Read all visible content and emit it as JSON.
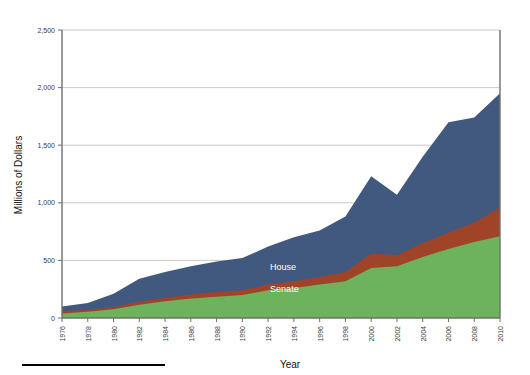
{
  "chart_data": {
    "type": "area",
    "stacked": true,
    "title": "",
    "subtitle": "",
    "xlabel": "Year",
    "ylabel": "Millions of Dollars",
    "xlim": [
      1976,
      2010
    ],
    "ylim": [
      0,
      2500
    ],
    "yticks": [
      0,
      500,
      1000,
      1500,
      2000,
      2500
    ],
    "ytick_labels": [
      "0",
      "500",
      "1,000",
      "1,500",
      "2,000",
      "2,500"
    ],
    "grid": "horizontal",
    "legend_position": "inline-annotations",
    "x": [
      1976,
      1978,
      1980,
      1982,
      1984,
      1986,
      1988,
      1990,
      1992,
      1994,
      1996,
      1998,
      2000,
      2002,
      2004,
      2006,
      2008,
      2010
    ],
    "xtick_labels": [
      "1976",
      "1978",
      "1980",
      "1982",
      "1984",
      "1986",
      "1988",
      "1990",
      "1992",
      "1994",
      "1996",
      "1998",
      "2000",
      "2002",
      "2004",
      "2006",
      "2008",
      "2010"
    ],
    "series": [
      {
        "name": "Senate",
        "color": "#6cb35c",
        "label_text": "Senate",
        "values": [
          40,
          55,
          75,
          115,
          145,
          170,
          185,
          200,
          240,
          260,
          290,
          320,
          435,
          450,
          530,
          600,
          660,
          710
        ]
      },
      {
        "name": "House",
        "color": "#a04429",
        "label_text": "House",
        "values": [
          60,
          70,
          95,
          140,
          175,
          205,
          225,
          240,
          290,
          320,
          355,
          400,
          560,
          545,
          650,
          740,
          830,
          960
        ]
      },
      {
        "name": "Total",
        "color": "#41597f",
        "label_text": "Total",
        "values": [
          100,
          130,
          210,
          340,
          400,
          450,
          490,
          520,
          620,
          700,
          760,
          880,
          1230,
          1070,
          1400,
          1700,
          1740,
          1950
        ]
      }
    ],
    "annotations": [
      {
        "text": "Total",
        "x": 1992,
        "y": 720
      },
      {
        "text": "House",
        "x": 1992,
        "y": 420
      },
      {
        "text": "Senate",
        "x": 1992,
        "y": 225
      }
    ],
    "colors": {
      "senate": "#6cb35c",
      "house": "#a04429",
      "total": "#41597f",
      "axis": "#6f6f6f",
      "gridline": "#c9c9c9",
      "background": "#ffffff",
      "label_text": "#3a3a3a"
    }
  }
}
